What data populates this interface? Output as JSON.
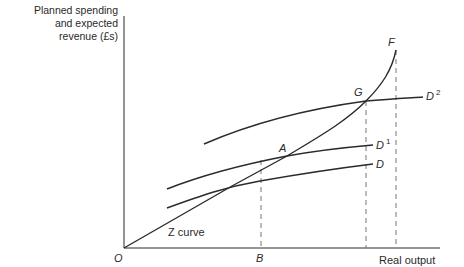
{
  "diagram": {
    "type": "economics-aggregate-demand",
    "y_axis_label_lines": [
      "Planned spending",
      "and expected",
      "revenue (£s)"
    ],
    "x_axis_label": "Real output",
    "origin_label": "O",
    "curves": {
      "z_curve": {
        "label": "Z curve",
        "endpoint_label": "F"
      },
      "d": {
        "label": "D",
        "superscript": ""
      },
      "d1": {
        "label": "D",
        "superscript": "1"
      },
      "d2": {
        "label": "D",
        "superscript": "2"
      }
    },
    "points": {
      "a": "A",
      "g": "G",
      "b": "B",
      "f": "F"
    },
    "colors": {
      "line": "#2a2a2a",
      "dashed": "#777777",
      "background": "#ffffff"
    }
  }
}
